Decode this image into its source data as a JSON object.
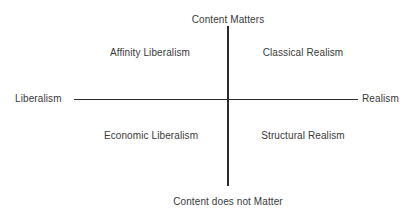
{
  "diagram": {
    "type": "quadrant-matrix",
    "background_color": "#ffffff",
    "line_color": "#2b2b2b",
    "text_color": "#3a3a3a",
    "axes": {
      "horizontal": {
        "left_label": "Liberalism",
        "right_label": "Realism"
      },
      "vertical": {
        "top_label": "Content Matters",
        "bottom_label": "Content does not Matter"
      }
    },
    "quadrants": [
      {
        "position": "upper-left",
        "label": "Affinity Liberalism"
      },
      {
        "position": "upper-right",
        "label": "Classical Realism"
      },
      {
        "position": "lower-left",
        "label": "Economic Liberalism"
      },
      {
        "position": "lower-right",
        "label": "Structural Realism"
      }
    ]
  }
}
